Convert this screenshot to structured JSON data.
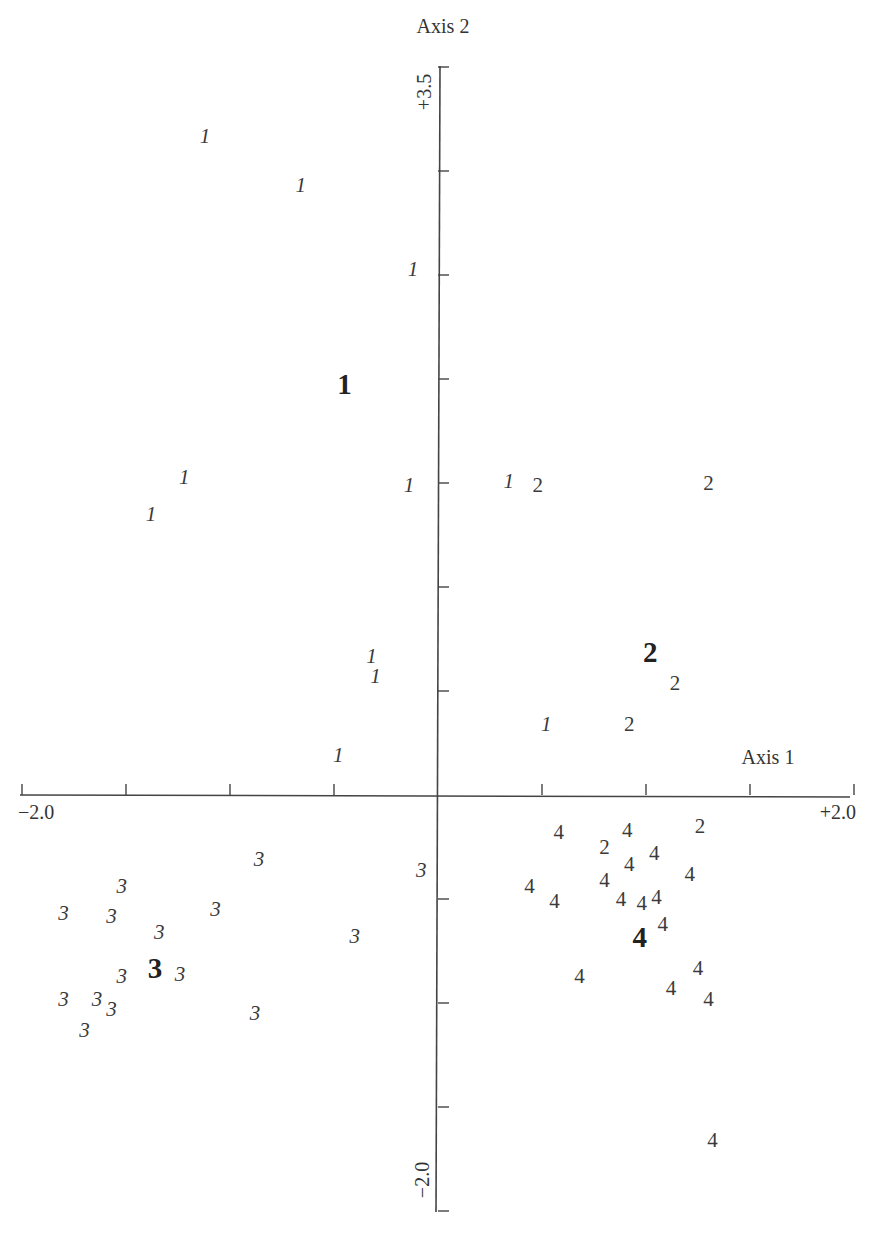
{
  "chart_data": {
    "type": "scatter",
    "title": "",
    "xlabel": "Axis 1",
    "ylabel": "Axis 2",
    "xlim": [
      -2.0,
      2.0
    ],
    "ylim": [
      -2.0,
      3.5
    ],
    "x_tick_step": 0.5,
    "y_tick_step": 0.5,
    "x_tick_labels": [
      "-2.0",
      "+2.0"
    ],
    "y_tick_labels": [
      "+3.5",
      "-2.0"
    ],
    "grid": false,
    "legend": "none; points are labelled by group number (1-4), bold labels mark group centroids",
    "series": [
      {
        "name": "1",
        "points": [
          [
            -1.12,
            3.16
          ],
          [
            -0.66,
            2.92
          ],
          [
            -0.12,
            2.52
          ],
          [
            -1.22,
            1.52
          ],
          [
            -1.38,
            1.34
          ],
          [
            -0.14,
            1.48
          ],
          [
            0.34,
            1.5
          ],
          [
            -0.32,
            0.66
          ],
          [
            -0.3,
            0.56
          ],
          [
            0.52,
            0.33
          ],
          [
            -0.48,
            0.18
          ]
        ],
        "centroid": [
          -0.45,
          1.96
        ]
      },
      {
        "name": "2",
        "points": [
          [
            0.48,
            1.48
          ],
          [
            1.3,
            1.49
          ],
          [
            1.14,
            0.53
          ],
          [
            0.92,
            0.33
          ],
          [
            0.8,
            -0.26
          ],
          [
            1.26,
            -0.16
          ]
        ],
        "centroid": [
          1.02,
          0.67
        ]
      },
      {
        "name": "3",
        "points": [
          [
            -0.86,
            -0.32
          ],
          [
            -0.08,
            -0.37
          ],
          [
            -1.52,
            -0.45
          ],
          [
            -1.8,
            -0.58
          ],
          [
            -1.57,
            -0.59
          ],
          [
            -1.07,
            -0.56
          ],
          [
            -1.34,
            -0.67
          ],
          [
            -0.4,
            -0.69
          ],
          [
            -1.52,
            -0.88
          ],
          [
            -1.24,
            -0.87
          ],
          [
            -1.8,
            -0.99
          ],
          [
            -1.64,
            -0.99
          ],
          [
            -1.57,
            -1.04
          ],
          [
            -0.88,
            -1.06
          ],
          [
            -1.7,
            -1.14
          ]
        ],
        "centroid": [
          -1.36,
          -0.85
        ]
      },
      {
        "name": "4",
        "points": [
          [
            0.58,
            -0.19
          ],
          [
            0.91,
            -0.18
          ],
          [
            0.92,
            -0.34
          ],
          [
            1.04,
            -0.29
          ],
          [
            1.21,
            -0.39
          ],
          [
            0.44,
            -0.45
          ],
          [
            0.56,
            -0.52
          ],
          [
            0.8,
            -0.42
          ],
          [
            0.88,
            -0.51
          ],
          [
            0.98,
            -0.53
          ],
          [
            1.05,
            -0.5
          ],
          [
            1.08,
            -0.63
          ],
          [
            0.68,
            -0.88
          ],
          [
            1.25,
            -0.84
          ],
          [
            1.12,
            -0.94
          ],
          [
            1.3,
            -0.99
          ],
          [
            1.32,
            -1.67
          ]
        ],
        "centroid": [
          0.97,
          -0.7
        ]
      }
    ]
  },
  "axes": {
    "x_label": "Axis 1",
    "y_label": "Axis 2",
    "x_min_label": "−2.0",
    "x_max_label": "+2.0",
    "y_max_label": "+3.5",
    "y_min_label": "−2.0"
  }
}
